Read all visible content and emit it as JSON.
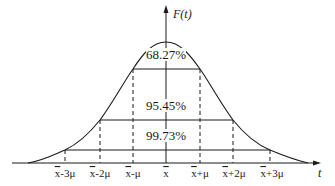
{
  "axis": {
    "y_label": "F(t)",
    "x_label": "t"
  },
  "regions": [
    {
      "label": "68.27%",
      "span": "x̄ ± μ"
    },
    {
      "label": "95.45%",
      "span": "x̄ ± 2μ"
    },
    {
      "label": "99.73%",
      "span": "x̄ ± 3μ"
    }
  ],
  "ticks": [
    {
      "base": "x",
      "suffix": "-3μ"
    },
    {
      "base": "x",
      "suffix": "-2μ"
    },
    {
      "base": "x",
      "suffix": "-μ"
    },
    {
      "base": "x",
      "suffix": ""
    },
    {
      "base": "x",
      "suffix": "+μ"
    },
    {
      "base": "x",
      "suffix": "+2μ"
    },
    {
      "base": "x",
      "suffix": "+3μ"
    }
  ],
  "colors": {
    "ink": "#1a1a1a",
    "background": "#ffffff"
  }
}
